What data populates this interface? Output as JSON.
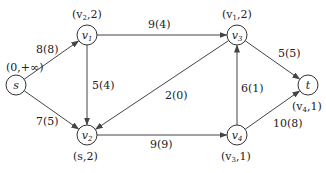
{
  "nodes": [
    {
      "id": "s",
      "name": "s",
      "sub": "",
      "x": 16,
      "y": 85,
      "label": "(0,+∞)",
      "lx": 6,
      "ly": 71
    },
    {
      "id": "v1",
      "name": "v",
      "sub": "1",
      "x": 87,
      "y": 35,
      "label_main": "(v",
      "label_sub": "2",
      "label_rest": ",2)",
      "lx": 72,
      "ly": 18
    },
    {
      "id": "v3",
      "name": "v",
      "sub": "3",
      "x": 237,
      "y": 35,
      "label_main": "(v",
      "label_sub": "1",
      "label_rest": ",2)",
      "lx": 222,
      "ly": 18
    },
    {
      "id": "t",
      "name": "t",
      "sub": "",
      "x": 308,
      "y": 85,
      "label_main": "(v",
      "label_sub": "4",
      "label_rest": ",1)",
      "lx": 292,
      "ly": 110
    },
    {
      "id": "v2",
      "name": "v",
      "sub": "2",
      "x": 87,
      "y": 135,
      "label": "(s,2)",
      "lx": 73,
      "ly": 160
    },
    {
      "id": "v4",
      "name": "v",
      "sub": "4",
      "x": 237,
      "y": 135,
      "label_main": "(v",
      "label_sub": "3",
      "label_rest": ",1)",
      "lx": 221,
      "ly": 160
    }
  ],
  "edges": [
    {
      "from": "s",
      "to": "v1",
      "label": "8(8)",
      "lx": 36,
      "ly": 53
    },
    {
      "from": "s",
      "to": "v2",
      "label": "7(5)",
      "lx": 36,
      "ly": 125
    },
    {
      "from": "v1",
      "to": "v3",
      "label": "9(4)",
      "lx": 148,
      "ly": 28
    },
    {
      "from": "v1",
      "to": "v2",
      "label": "5(4)",
      "lx": 92,
      "ly": 89
    },
    {
      "from": "v3",
      "to": "v2",
      "label": "2(0)",
      "lx": 165,
      "ly": 99
    },
    {
      "from": "v3",
      "to": "t",
      "label": "5(5)",
      "lx": 278,
      "ly": 57
    },
    {
      "from": "v2",
      "to": "v4",
      "label": "9(9)",
      "lx": 150,
      "ly": 148
    },
    {
      "from": "v4",
      "to": "v3",
      "label": "6(1)",
      "lx": 241,
      "ly": 92
    },
    {
      "from": "v4",
      "to": "t",
      "label": "10(8)",
      "lx": 273,
      "ly": 127
    }
  ]
}
